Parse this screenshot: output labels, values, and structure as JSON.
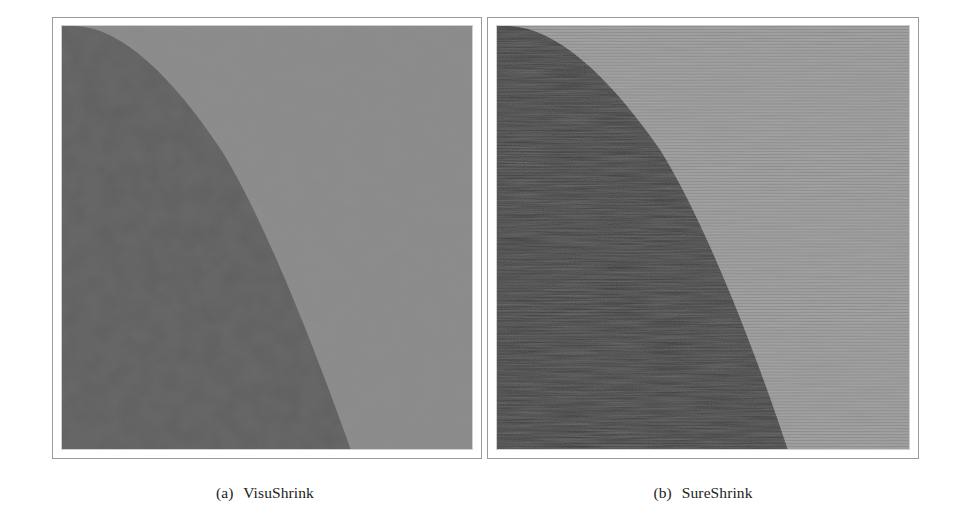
{
  "figure": {
    "panels": [
      {
        "id": "a",
        "label": "(a)",
        "title": "VisuShrink",
        "image": {
          "description": "denoised test image: dark curved region on left, lighter gray region on right",
          "dark_color": "#3a3a3a",
          "light_color": "#9a9a9a",
          "noise_style": "fine grain"
        }
      },
      {
        "id": "b",
        "label": "(b)",
        "title": "SureShrink",
        "image": {
          "description": "denoised test image: dark curved region on left, lighter gray region on right, with horizontal streak artifacts",
          "dark_color": "#343434",
          "light_color": "#959595",
          "noise_style": "horizontal streaks"
        }
      }
    ]
  }
}
